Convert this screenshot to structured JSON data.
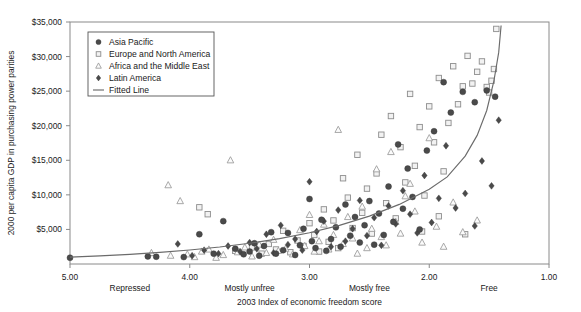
{
  "chart_data": {
    "type": "scatter",
    "title": "",
    "xlabel": "2003 Index of economic freedom score",
    "ylabel": "2000 per capita GDP in purchasing power parities",
    "xlim": [
      5.0,
      1.0
    ],
    "ylim": [
      0,
      35000
    ],
    "x_reversed": true,
    "grid": false,
    "legend_position": "top-left",
    "xticks": [
      "5.00",
      "4.00",
      "3.00",
      "2.00",
      "1.00"
    ],
    "xtick_values": [
      5.0,
      4.0,
      3.0,
      2.0,
      1.0
    ],
    "x_category_labels": [
      "Repressed",
      "Mostly unfree",
      "Mostly free",
      "Free"
    ],
    "x_category_centers": [
      4.5,
      3.5,
      2.5,
      1.5
    ],
    "yticks": [
      "$5,000",
      "$10,000",
      "$15,000",
      "$20,000",
      "$25,000",
      "$30,000",
      "$35,000"
    ],
    "ytick_values": [
      5000,
      10000,
      15000,
      20000,
      25000,
      30000,
      35000
    ],
    "series": [
      {
        "name": "Asia Pacific",
        "marker": "filled-circle",
        "color": "#4a4a4a",
        "points": [
          [
            5.0,
            900
          ],
          [
            4.35,
            1100
          ],
          [
            4.28,
            1050
          ],
          [
            4.05,
            1000
          ],
          [
            3.92,
            4300
          ],
          [
            3.8,
            1500
          ],
          [
            3.72,
            6200
          ],
          [
            3.62,
            2200
          ],
          [
            3.55,
            1400
          ],
          [
            3.5,
            1800
          ],
          [
            3.46,
            3000
          ],
          [
            3.42,
            1200
          ],
          [
            3.38,
            2600
          ],
          [
            3.32,
            4600
          ],
          [
            3.28,
            1500
          ],
          [
            3.22,
            2000
          ],
          [
            3.18,
            4500
          ],
          [
            3.12,
            1300
          ],
          [
            3.08,
            2700
          ],
          [
            3.05,
            5100
          ],
          [
            3.0,
            9400
          ],
          [
            2.98,
            3300
          ],
          [
            2.95,
            2300
          ],
          [
            2.9,
            6400
          ],
          [
            2.86,
            1900
          ],
          [
            2.82,
            3600
          ],
          [
            2.78,
            5300
          ],
          [
            2.74,
            2500
          ],
          [
            2.7,
            8600
          ],
          [
            2.66,
            4100
          ],
          [
            2.62,
            6800
          ],
          [
            2.58,
            3100
          ],
          [
            2.54,
            5600
          ],
          [
            2.5,
            9100
          ],
          [
            2.46,
            2800
          ],
          [
            2.42,
            7300
          ],
          [
            2.38,
            4200
          ],
          [
            2.34,
            11200
          ],
          [
            2.3,
            6100
          ],
          [
            2.26,
            17300
          ],
          [
            2.22,
            8000
          ],
          [
            2.18,
            13800
          ],
          [
            2.14,
            9700
          ],
          [
            2.08,
            5000
          ],
          [
            2.02,
            16400
          ],
          [
            1.96,
            19200
          ],
          [
            1.88,
            26300
          ],
          [
            1.82,
            21900
          ],
          [
            1.72,
            24900
          ],
          [
            1.62,
            23400
          ],
          [
            1.52,
            25100
          ],
          [
            1.45,
            24200
          ]
        ]
      },
      {
        "name": "Europe and North America",
        "marker": "open-square",
        "color": "#8d8d8d",
        "points": [
          [
            3.92,
            8200
          ],
          [
            3.85,
            7200
          ],
          [
            3.62,
            1900
          ],
          [
            3.48,
            2400
          ],
          [
            3.4,
            1500
          ],
          [
            3.34,
            2900
          ],
          [
            3.28,
            2100
          ],
          [
            3.22,
            4800
          ],
          [
            3.16,
            1700
          ],
          [
            3.1,
            3400
          ],
          [
            3.05,
            2600
          ],
          [
            3.0,
            5900
          ],
          [
            2.96,
            4200
          ],
          [
            2.92,
            1800
          ],
          [
            2.88,
            7900
          ],
          [
            2.84,
            3200
          ],
          [
            2.8,
            6300
          ],
          [
            2.76,
            2300
          ],
          [
            2.72,
            12400
          ],
          [
            2.68,
            9600
          ],
          [
            2.64,
            5200
          ],
          [
            2.6,
            15800
          ],
          [
            2.56,
            7400
          ],
          [
            2.52,
            10900
          ],
          [
            2.48,
            4400
          ],
          [
            2.44,
            13100
          ],
          [
            2.4,
            18700
          ],
          [
            2.36,
            8800
          ],
          [
            2.32,
            21400
          ],
          [
            2.28,
            6600
          ],
          [
            2.24,
            16900
          ],
          [
            2.2,
            11800
          ],
          [
            2.16,
            24600
          ],
          [
            2.12,
            14200
          ],
          [
            2.08,
            19800
          ],
          [
            2.04,
            9900
          ],
          [
            2.0,
            22800
          ],
          [
            1.96,
            17600
          ],
          [
            1.92,
            26900
          ],
          [
            1.88,
            13400
          ],
          [
            1.84,
            20400
          ],
          [
            1.8,
            28600
          ],
          [
            1.76,
            23100
          ],
          [
            1.72,
            25700
          ],
          [
            1.68,
            30100
          ],
          [
            1.64,
            26100
          ],
          [
            1.6,
            27800
          ],
          [
            1.56,
            29300
          ],
          [
            1.52,
            25600
          ],
          [
            1.5,
            24800
          ],
          [
            1.48,
            26500
          ],
          [
            1.46,
            28200
          ],
          [
            1.44,
            34000
          ],
          [
            1.92,
            6900
          ],
          [
            2.06,
            4700
          ],
          [
            1.7,
            4300
          ]
        ]
      },
      {
        "name": "Africa and the Middle East",
        "marker": "open-triangle",
        "color": "#9a9a9a",
        "points": [
          [
            4.32,
            1600
          ],
          [
            4.18,
            11400
          ],
          [
            4.16,
            1200
          ],
          [
            4.08,
            9100
          ],
          [
            4.02,
            1400
          ],
          [
            3.96,
            1000
          ],
          [
            3.9,
            1800
          ],
          [
            3.84,
            2100
          ],
          [
            3.78,
            900
          ],
          [
            3.72,
            1300
          ],
          [
            3.66,
            15000
          ],
          [
            3.6,
            1700
          ],
          [
            3.54,
            2400
          ],
          [
            3.48,
            1100
          ],
          [
            3.42,
            2800
          ],
          [
            3.36,
            1600
          ],
          [
            3.3,
            3500
          ],
          [
            3.26,
            1900
          ],
          [
            3.2,
            2200
          ],
          [
            3.14,
            1400
          ],
          [
            3.08,
            4900
          ],
          [
            3.04,
            2600
          ],
          [
            3.0,
            7100
          ],
          [
            2.96,
            1800
          ],
          [
            2.92,
            3300
          ],
          [
            2.88,
            5700
          ],
          [
            2.84,
            2100
          ],
          [
            2.8,
            4200
          ],
          [
            2.76,
            19400
          ],
          [
            2.72,
            2900
          ],
          [
            2.68,
            6800
          ],
          [
            2.64,
            3700
          ],
          [
            2.6,
            1500
          ],
          [
            2.56,
            8300
          ],
          [
            2.52,
            2300
          ],
          [
            2.48,
            5100
          ],
          [
            2.44,
            13700
          ],
          [
            2.4,
            3900
          ],
          [
            2.36,
            2700
          ],
          [
            2.32,
            16200
          ],
          [
            2.28,
            6100
          ],
          [
            2.24,
            4400
          ],
          [
            2.2,
            9800
          ],
          [
            2.16,
            11600
          ],
          [
            2.12,
            7600
          ],
          [
            2.06,
            3100
          ],
          [
            2.0,
            18200
          ],
          [
            1.94,
            5400
          ],
          [
            1.88,
            2500
          ],
          [
            1.8,
            8900
          ],
          [
            1.72,
            4600
          ],
          [
            1.6,
            6300
          ]
        ]
      },
      {
        "name": "Latin America",
        "marker": "filled-diamond",
        "color": "#4a4a4a",
        "points": [
          [
            4.1,
            2900
          ],
          [
            3.98,
            1200
          ],
          [
            3.88,
            2000
          ],
          [
            3.76,
            1500
          ],
          [
            3.68,
            2600
          ],
          [
            3.58,
            1800
          ],
          [
            3.5,
            3100
          ],
          [
            3.44,
            2200
          ],
          [
            3.36,
            4300
          ],
          [
            3.3,
            1600
          ],
          [
            3.24,
            5600
          ],
          [
            3.18,
            2800
          ],
          [
            3.12,
            3600
          ],
          [
            3.06,
            2000
          ],
          [
            3.0,
            11900
          ],
          [
            2.94,
            4700
          ],
          [
            2.88,
            6200
          ],
          [
            2.82,
            2500
          ],
          [
            2.76,
            7800
          ],
          [
            2.7,
            3300
          ],
          [
            2.64,
            5100
          ],
          [
            2.58,
            9200
          ],
          [
            2.52,
            4100
          ],
          [
            2.46,
            6700
          ],
          [
            2.4,
            2700
          ],
          [
            2.34,
            8400
          ],
          [
            2.28,
            5800
          ],
          [
            2.22,
            10600
          ],
          [
            2.16,
            7200
          ],
          [
            2.1,
            4500
          ],
          [
            2.04,
            12800
          ],
          [
            1.98,
            6000
          ],
          [
            1.92,
            9500
          ],
          [
            1.86,
            17100
          ],
          [
            1.78,
            8100
          ],
          [
            1.7,
            10200
          ],
          [
            1.62,
            5500
          ],
          [
            1.56,
            14900
          ],
          [
            1.48,
            11300
          ],
          [
            1.42,
            20800
          ]
        ]
      }
    ],
    "fitted_line": {
      "name": "Fitted Line",
      "color": "#6b6b6b",
      "points": [
        [
          5.0,
          1000
        ],
        [
          4.75,
          1180
        ],
        [
          4.5,
          1400
        ],
        [
          4.25,
          1680
        ],
        [
          4.0,
          2030
        ],
        [
          3.75,
          2460
        ],
        [
          3.5,
          3000
        ],
        [
          3.25,
          3680
        ],
        [
          3.0,
          4520
        ],
        [
          2.75,
          5580
        ],
        [
          2.5,
          6920
        ],
        [
          2.25,
          8620
        ],
        [
          2.0,
          10800
        ],
        [
          1.85,
          12600
        ],
        [
          1.7,
          15600
        ],
        [
          1.6,
          18600
        ],
        [
          1.52,
          22200
        ],
        [
          1.46,
          26500
        ],
        [
          1.42,
          30600
        ],
        [
          1.4,
          34500
        ]
      ]
    }
  },
  "legend": {
    "entries": [
      {
        "label": "Asia Pacific",
        "marker": "filled-circle"
      },
      {
        "label": "Europe and North America",
        "marker": "open-square"
      },
      {
        "label": "Africa and the Middle East",
        "marker": "open-triangle"
      },
      {
        "label": "Latin America",
        "marker": "filled-diamond"
      },
      {
        "label": "Fitted Line",
        "marker": "line"
      }
    ]
  }
}
